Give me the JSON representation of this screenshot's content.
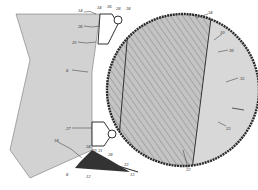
{
  "figure": {
    "type": "patent-drawing",
    "colors": {
      "background": "#ffffff",
      "frame_fill": "#d2d2d2",
      "roller_outline": "#2a2a2a",
      "hatched_core": "#bdbdbd",
      "end_region": "#d8d8d8",
      "line": "#333333"
    }
  },
  "labels": {
    "l10": "10",
    "l12": "12",
    "l13": "13",
    "l14": "14",
    "l16": "16",
    "l18": "18",
    "l20": "20",
    "l22": "22",
    "l23": "23",
    "l24": "24",
    "l25": "25",
    "l26": "26",
    "l27": "27",
    "l28": "28",
    "l29": "29",
    "l30": "30",
    "l31": "31",
    "l32": "32",
    "l33": "33",
    "l34": "34",
    "l35": "35",
    "l36": "36",
    "l38": "38",
    "l6": "6",
    "l8": "8"
  }
}
